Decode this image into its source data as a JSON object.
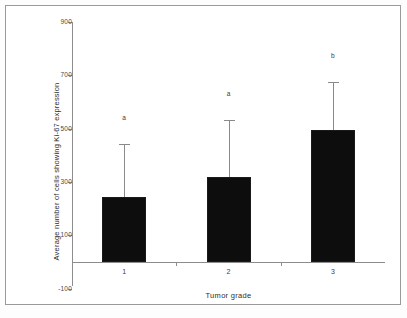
{
  "figure": {
    "frame_visible": true,
    "background_color": "#ffffff",
    "border_color": "#9a9a9a"
  },
  "chart_data": {
    "type": "bar",
    "title": "",
    "subtitle": "",
    "xlabel": "Tumor grade",
    "ylabel": "Average number of cells showing Ki-67 expression",
    "categories": [
      "1",
      "2",
      "3"
    ],
    "values": [
      244,
      319,
      495
    ],
    "errors_upper": [
      198,
      214,
      180
    ],
    "error_bar_tops": [
      442,
      533,
      675
    ],
    "error_bar_style": "upper-only-with-cap",
    "point_labels": [
      "a",
      "a",
      "b"
    ],
    "ylim": [
      -100,
      900
    ],
    "yticks": [
      900,
      700,
      500,
      300,
      100,
      -100
    ],
    "ytick_labels": [
      "900",
      "700",
      "500",
      "300",
      "100",
      "-100"
    ],
    "grid": false,
    "legend": "none",
    "bar_color": "#0d0d0d",
    "bar_edge_color": "#1a1a1a",
    "axis_color": "#8d8d8d",
    "error_bar_color": "#8a8a8a",
    "series": [
      {
        "name": "Ki-67 expressing cells",
        "values": [
          244,
          319,
          495
        ],
        "errors_upper": [
          198,
          214,
          180
        ]
      }
    ]
  },
  "annotations": {
    "significance_note": [
      "a",
      "a",
      "b"
    ]
  }
}
